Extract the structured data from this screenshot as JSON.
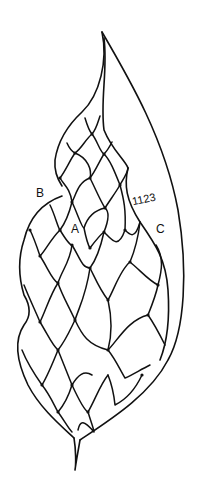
{
  "figure": {
    "type": "botanical line drawing",
    "labels": {
      "a": "A",
      "b": "B",
      "c": "C",
      "specimen_number": "1123"
    },
    "colors": {
      "ink": "#111111",
      "background": "#ffffff"
    }
  }
}
